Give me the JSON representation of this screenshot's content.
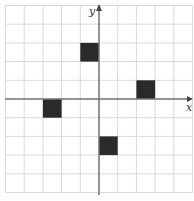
{
  "diagram": {
    "type": "coordinate-grid",
    "x_axis_label": "x",
    "y_axis_label": "y",
    "grid": {
      "xmin": -5,
      "xmax": 5,
      "ymin": -5,
      "ymax": 5,
      "step": 1
    },
    "grid_color": "#d9d9d9",
    "axis_color": "#777777",
    "square_color": "#2a2a2a",
    "shaded_squares": [
      {
        "x0": -1,
        "y0": 2,
        "x1": 0,
        "y1": 3
      },
      {
        "x0": -3,
        "y0": -1,
        "x1": -2,
        "y1": 0
      },
      {
        "x0": 2,
        "y0": 0,
        "x1": 3,
        "y1": 1
      },
      {
        "x0": 0,
        "y0": -3,
        "x1": 1,
        "y1": -2
      }
    ]
  }
}
